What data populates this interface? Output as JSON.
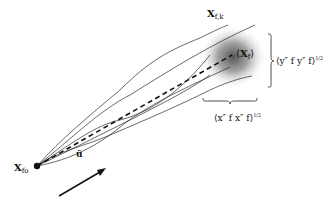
{
  "diagram": {
    "labels": {
      "start_point": {
        "main": "X",
        "sub": "fo"
      },
      "trajectory_k": {
        "main": "X",
        "sub": "f,k"
      },
      "mean_endpoint": {
        "open": "⟨",
        "main": "X",
        "sub": "f",
        "close": "⟩"
      },
      "y_spread": {
        "text": "⟨y″ f y″ f⟩",
        "exp": "1/2"
      },
      "x_spread": {
        "text": "⟨x″ f x″ f⟩",
        "exp": "1/2"
      },
      "velocity": {
        "main": "ū"
      }
    },
    "colors": {
      "line": "#2a2a2a",
      "dashed": "#111111",
      "blob_center": "#555555",
      "background": "#ffffff"
    }
  }
}
